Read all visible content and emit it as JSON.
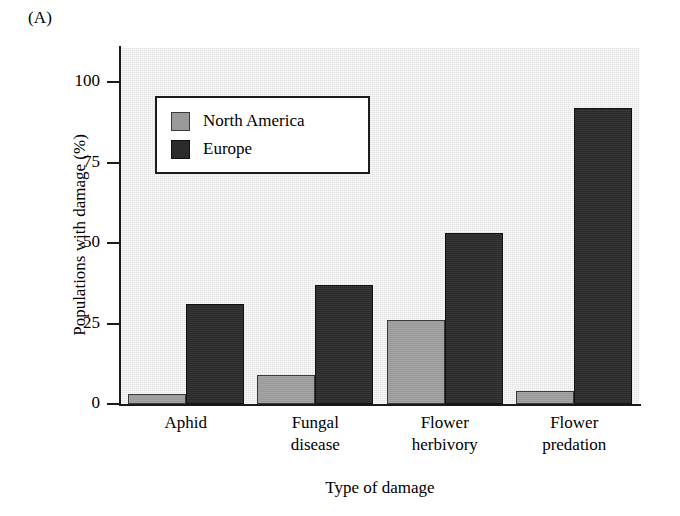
{
  "panel": {
    "label": "(A)"
  },
  "chart_data": {
    "type": "bar",
    "title": "",
    "xlabel": "Type of damage",
    "ylabel": "Populations with damage (%)",
    "categories": [
      "Aphid",
      "Fungal disease",
      "Flower herbivory",
      "Flower predation"
    ],
    "category_lines": [
      [
        "Aphid"
      ],
      [
        "Fungal",
        "disease"
      ],
      [
        "Flower",
        "herbivory"
      ],
      [
        "Flower",
        "predation"
      ]
    ],
    "series": [
      {
        "name": "North America",
        "color": "#9a9a9a",
        "values": [
          3,
          9,
          26,
          4
        ]
      },
      {
        "name": "Europe",
        "color": "#2b2b2b",
        "values": [
          31,
          37,
          53,
          92
        ]
      }
    ],
    "ylim": [
      0,
      107
    ],
    "yticks": [
      0,
      25,
      50,
      75,
      100
    ],
    "ytick_labels": [
      "0",
      "25",
      "50",
      "75",
      "100"
    ],
    "grid": false,
    "legend_position": "upper-left-inside",
    "plot_background": "#e3e3e3"
  },
  "legend": {
    "entries": [
      {
        "label": "North America",
        "swatch": "north-america-swatch"
      },
      {
        "label": "Europe",
        "swatch": "europe-swatch"
      }
    ]
  }
}
